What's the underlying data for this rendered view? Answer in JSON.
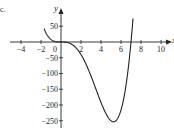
{
  "corner_label": "c.",
  "chart_data": {
    "type": "line",
    "title": "",
    "xlabel": "x",
    "ylabel": "y",
    "xlim": [
      -5,
      11
    ],
    "ylim": [
      -260,
      65
    ],
    "grid": false,
    "x_ticks": [
      -4,
      -2,
      0,
      2,
      4,
      6,
      8,
      10
    ],
    "x_tick_labels": [
      "-4",
      "-2",
      "0",
      "2",
      "4",
      "6",
      "8",
      "10"
    ],
    "y_ticks": [
      50,
      -50,
      -100,
      -150,
      -200,
      -250
    ],
    "y_tick_labels": [
      "50",
      "-50",
      "-100",
      "-150",
      "-200",
      "-250"
    ],
    "function": "y = x^3 (x - 7)",
    "series": [
      {
        "name": "curve",
        "color": "#222222",
        "x": [
          -1.7,
          -1.5,
          -1,
          -0.5,
          0,
          0.5,
          1,
          1.5,
          2,
          2.5,
          3,
          3.5,
          4,
          4.5,
          5,
          5.25,
          5.5,
          6,
          6.5,
          7,
          7.2
        ],
        "y": [
          42,
          29,
          8,
          0.9,
          0,
          -0.8,
          -6,
          -18,
          -40,
          -70,
          -108,
          -150,
          -192,
          -228,
          -250,
          -253,
          -250,
          -216,
          -137,
          0,
          75
        ]
      }
    ],
    "annotations": [
      {
        "label": "local minimum",
        "x": 5.25,
        "y": -253
      },
      {
        "label": "root",
        "x": 0,
        "y": 0
      },
      {
        "label": "root",
        "x": 7,
        "y": 0
      }
    ]
  }
}
